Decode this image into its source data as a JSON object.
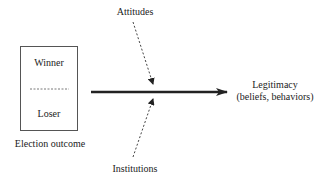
{
  "diagram": {
    "box": {
      "top_label": "Winner",
      "bottom_label": "Loser",
      "caption": "Election outcome"
    },
    "influences": {
      "top": "Attitudes",
      "bottom": "Institutions"
    },
    "outcome": {
      "line1": "Legitimacy",
      "line2": "(beliefs, behaviors)"
    },
    "colors": {
      "line": "#222222",
      "box_border": "#555555",
      "dashed": "#444444"
    }
  }
}
